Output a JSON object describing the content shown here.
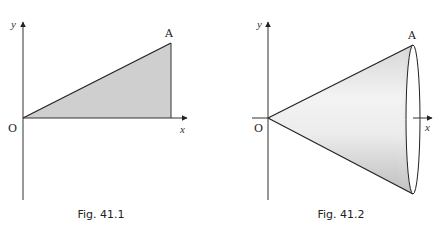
{
  "figures": [
    {
      "id": "fig-41-1",
      "caption": "Fig. 41.1",
      "axis_labels": {
        "x": "x",
        "y": "y"
      },
      "origin_label": "O",
      "point_label": "A",
      "shape": "right-triangle",
      "fill_color": "#cfcfcf"
    },
    {
      "id": "fig-41-2",
      "caption": "Fig. 41.2",
      "axis_labels": {
        "x": "x",
        "y": "y"
      },
      "origin_label": "O",
      "point_label": "A",
      "shape": "cone",
      "fill_color_light": "#f2f2f2",
      "fill_color_dark": "#c4c4c4"
    }
  ]
}
